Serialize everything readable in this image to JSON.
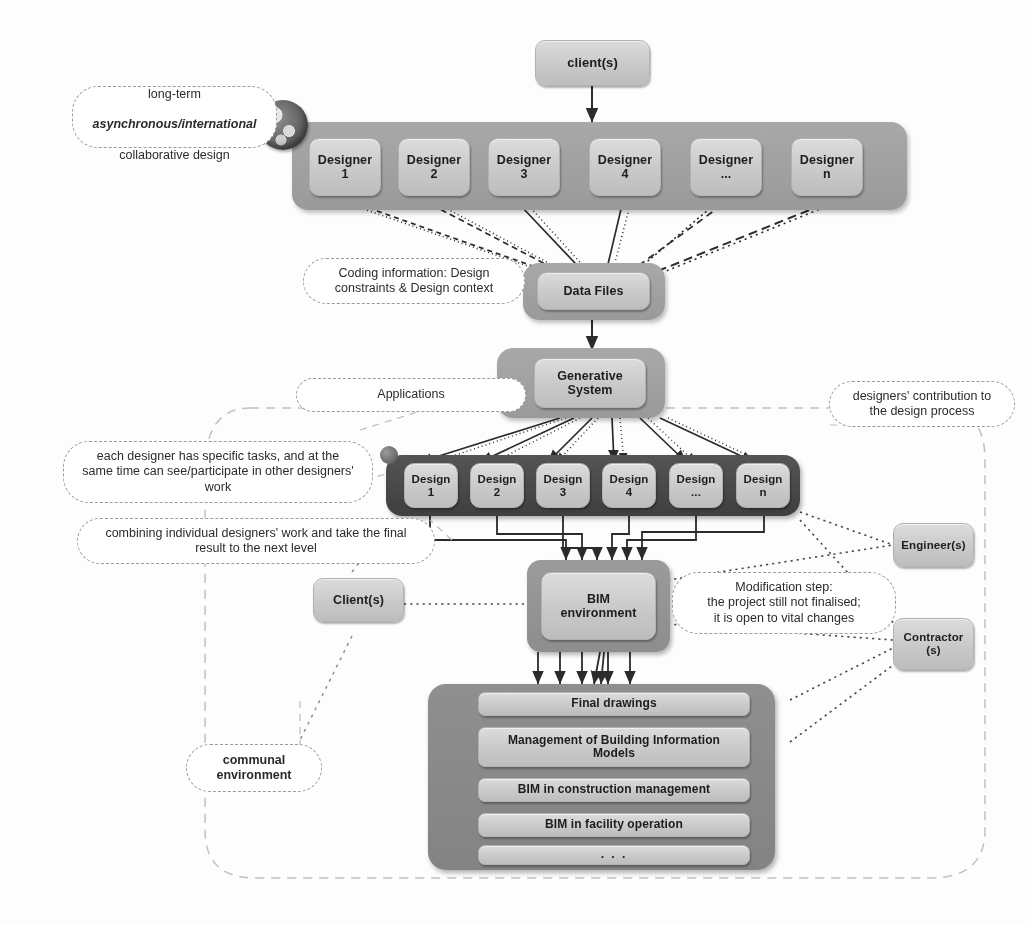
{
  "diagram": {
    "colors": {
      "band_mid_gray": "#9e9e9e",
      "band_dark_gray": "#4b4b4b",
      "node_fill": "#cfcfcf",
      "boundary_dash": "#b9b9b9",
      "arrow": "#2b2b2b"
    }
  },
  "top": {
    "client_label": "client(s)"
  },
  "designer_band": {
    "globe_icon": "globe-icon",
    "cells": [
      {
        "line1": "Designer",
        "line2": "1"
      },
      {
        "line1": "Designer",
        "line2": "2"
      },
      {
        "line1": "Designer",
        "line2": "3"
      },
      {
        "line1": "Designer",
        "line2": "4"
      },
      {
        "line1": "Designer",
        "line2": "..."
      },
      {
        "line1": "Designer",
        "line2": "n"
      }
    ]
  },
  "data_files": {
    "label": "Data Files"
  },
  "generative_system": {
    "line1": "Generative",
    "line2": "System"
  },
  "design_band": {
    "cells": [
      {
        "line1": "Design",
        "line2": "1"
      },
      {
        "line1": "Design",
        "line2": "2"
      },
      {
        "line1": "Design",
        "line2": "3"
      },
      {
        "line1": "Design",
        "line2": "4"
      },
      {
        "line1": "Design",
        "line2": "..."
      },
      {
        "line1": "Design",
        "line2": "n"
      }
    ]
  },
  "bim": {
    "line1": "BIM",
    "line2": "environment"
  },
  "actors": {
    "client": "Client(s)",
    "engineer": "Engineer(s)",
    "contractor_line1": "Contractor",
    "contractor_line2": "(s)"
  },
  "outputs": {
    "rows": [
      "Final drawings",
      "Management of Building Information\nModels",
      "BIM in construction management",
      "BIM in facility operation",
      ". . ."
    ]
  },
  "callouts": {
    "longterm": {
      "line1": "long-term",
      "line2": "asynchronous/international",
      "line3": "collaborative design"
    },
    "coding": "Coding information: Design\nconstraints & Design context",
    "applications": "Applications",
    "contribution": "designers' contribution to\nthe design process",
    "tasks": "each designer has specific tasks, and at the\nsame time can see/participate in other designers'\nwork",
    "combining": "combining individual designers' work and take the final\nresult to the next level",
    "modification": "Modification step:\nthe project still not finalised;\nit is open to vital changes",
    "communal": "communal\nenvironment"
  }
}
